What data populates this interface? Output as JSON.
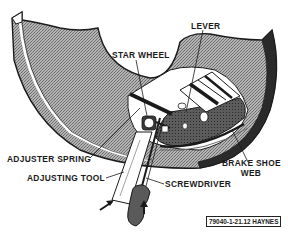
{
  "figure": {
    "reference": "79040-1-21.12 HAYNES"
  },
  "labels": {
    "lever": "LEVER",
    "star_wheel": "STAR WHEEL",
    "adjuster_spring": "ADJUSTER SPRING",
    "adjusting_tool": "ADJUSTING TOOL",
    "screwdriver": "SCREWDRIVER",
    "brake_shoe_web_line1": "BRAKE SHOE",
    "brake_shoe_web_line2": "WEB"
  },
  "colors": {
    "ink": "#1a1a1a",
    "backing_plate_fill": "#9a9a9a",
    "shoe_fill": "#5a5a5a",
    "paper": "#ffffff"
  }
}
